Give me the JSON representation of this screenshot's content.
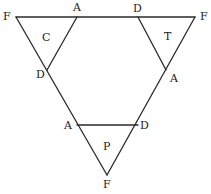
{
  "diagram": {
    "type": "triangle-folding-net",
    "stroke_color": "#2a2a2a",
    "vertices": {
      "top_left_F": {
        "label": "F",
        "x": 16,
        "y": 17
      },
      "top_A": {
        "label": "A",
        "x": 77,
        "y": 17
      },
      "top_D": {
        "label": "D",
        "x": 138,
        "y": 17
      },
      "top_right_F": {
        "label": "F",
        "x": 195,
        "y": 17
      },
      "left_D": {
        "label": "D",
        "x": 47,
        "y": 70
      },
      "right_A": {
        "label": "A",
        "x": 166,
        "y": 70
      },
      "bottom_A": {
        "label": "A",
        "x": 77,
        "y": 125
      },
      "bottom_D": {
        "label": "D",
        "x": 138,
        "y": 125
      },
      "bottom_F": {
        "label": "F",
        "x": 107,
        "y": 175
      }
    },
    "faces": [
      {
        "label": "C",
        "position": "top-left"
      },
      {
        "label": "T",
        "position": "top-right"
      },
      {
        "label": "P",
        "position": "bottom"
      }
    ],
    "labels": {
      "f_top_left": "F",
      "a_top": "A",
      "d_top": "D",
      "f_top_right": "F",
      "d_left": "D",
      "a_right": "A",
      "a_bottom": "A",
      "d_bottom": "D",
      "f_bottom": "F",
      "face_c": "C",
      "face_t": "T",
      "face_p": "P"
    }
  }
}
